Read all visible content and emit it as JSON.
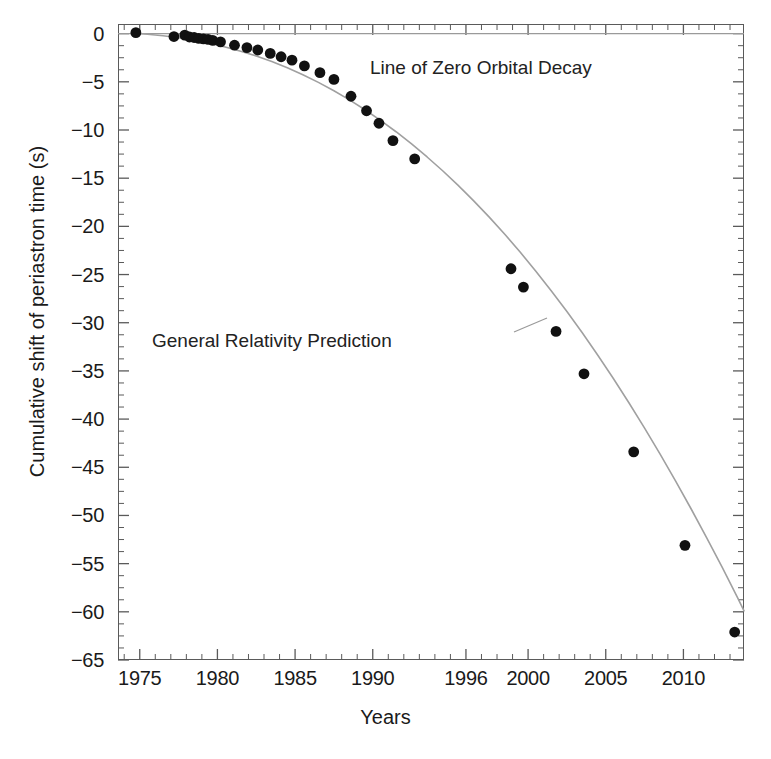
{
  "chart_data": {
    "type": "scatter",
    "title": "",
    "xlabel": "Years",
    "ylabel": "Cumulative shift of periastron time (s)",
    "xlim": [
      1973.6,
      2013.9
    ],
    "ylim": [
      -65,
      1.0
    ],
    "grid": false,
    "legend": "none",
    "xticks": [
      1975,
      1980,
      1985,
      1990,
      1996,
      2000,
      2005,
      2010
    ],
    "xtick_labels": [
      "1975",
      "1980",
      "1985",
      "1990",
      "1996",
      "2000",
      "2005",
      "2010"
    ],
    "yticks": [
      0,
      -5,
      -10,
      -15,
      -20,
      -25,
      -30,
      -35,
      -40,
      -45,
      -50,
      -55,
      -60,
      -65
    ],
    "ytick_labels": [
      "0",
      "−5",
      "−10",
      "−15",
      "−20",
      "−25",
      "−30",
      "−35",
      "−40",
      "−45",
      "−50",
      "−55",
      "−60",
      "−65"
    ],
    "x_minor_tick_step": 1,
    "y_minor_tick_step": 1.25,
    "annotations": [
      {
        "id": "zero-decay",
        "text": "Line of Zero Orbital Decay",
        "x": 1990.0,
        "y": -1.6
      },
      {
        "id": "gr-prediction",
        "text": "General Relativity Prediction",
        "x": 1979.0,
        "y": -29.6
      }
    ],
    "reference_lines": [
      {
        "id": "zero-line",
        "orientation": "horizontal",
        "y": 0,
        "color": "#9a9a9a",
        "label": "Line of Zero Orbital Decay"
      }
    ],
    "series": [
      {
        "name": "General Relativity Prediction",
        "type": "line",
        "color": "#a0a0a0",
        "points": [
          [
            1974.6,
            0.05
          ],
          [
            1975.5,
            -0.07
          ],
          [
            1976.5,
            -0.22
          ],
          [
            1977.5,
            -0.42
          ],
          [
            1978.5,
            -0.68
          ],
          [
            1979.5,
            -1.0
          ],
          [
            1980.5,
            -1.38
          ],
          [
            1981.5,
            -1.82
          ],
          [
            1982.5,
            -2.32
          ],
          [
            1983.5,
            -2.9
          ],
          [
            1984.5,
            -3.55
          ],
          [
            1985.5,
            -4.27
          ],
          [
            1986.5,
            -5.06
          ],
          [
            1987.5,
            -5.93
          ],
          [
            1988.5,
            -6.88
          ],
          [
            1989.5,
            -7.9
          ],
          [
            1990.5,
            -9.0
          ],
          [
            1991.5,
            -10.18
          ],
          [
            1992.5,
            -11.45
          ],
          [
            1993.5,
            -12.8
          ],
          [
            1994.5,
            -14.23
          ],
          [
            1995.5,
            -15.75
          ],
          [
            1996.5,
            -17.35
          ],
          [
            1997.5,
            -19.04
          ],
          [
            1998.5,
            -20.82
          ],
          [
            1999.5,
            -22.69
          ],
          [
            2000.5,
            -24.65
          ],
          [
            2001.5,
            -26.7
          ],
          [
            2002.5,
            -28.84
          ],
          [
            2003.5,
            -31.07
          ],
          [
            2004.5,
            -33.4
          ],
          [
            2005.5,
            -35.82
          ],
          [
            2006.5,
            -38.33
          ],
          [
            2007.5,
            -40.94
          ],
          [
            2008.5,
            -43.64
          ],
          [
            2009.5,
            -46.44
          ],
          [
            2010.5,
            -49.33
          ],
          [
            2011.5,
            -52.32
          ],
          [
            2012.5,
            -55.4
          ],
          [
            2013.5,
            -58.58
          ],
          [
            2013.9,
            -59.9
          ]
        ]
      },
      {
        "name": "Measured cumulative periastron shift",
        "type": "scatter",
        "color": "#111111",
        "marker": "filled-circle",
        "points": [
          [
            1974.75,
            0.1
          ],
          [
            1977.2,
            -0.3
          ],
          [
            1977.9,
            -0.15
          ],
          [
            1978.2,
            -0.35
          ],
          [
            1978.5,
            -0.4
          ],
          [
            1978.8,
            -0.5
          ],
          [
            1979.1,
            -0.55
          ],
          [
            1979.4,
            -0.6
          ],
          [
            1979.7,
            -0.7
          ],
          [
            1980.2,
            -0.85
          ],
          [
            1981.1,
            -1.2
          ],
          [
            1981.9,
            -1.45
          ],
          [
            1982.6,
            -1.7
          ],
          [
            1983.4,
            -2.05
          ],
          [
            1984.1,
            -2.4
          ],
          [
            1984.8,
            -2.75
          ],
          [
            1985.6,
            -3.35
          ],
          [
            1986.6,
            -4.05
          ],
          [
            1987.5,
            -4.75
          ],
          [
            1988.6,
            -6.5
          ],
          [
            1989.6,
            -8.0
          ],
          [
            1990.4,
            -9.3
          ],
          [
            1991.3,
            -11.1
          ],
          [
            1992.7,
            -13.0
          ],
          [
            1998.9,
            -24.4
          ],
          [
            1999.7,
            -26.3
          ],
          [
            2001.8,
            -30.9
          ],
          [
            2003.6,
            -35.3
          ],
          [
            2006.8,
            -43.4
          ],
          [
            2010.1,
            -53.1
          ],
          [
            2013.3,
            -62.1
          ]
        ]
      }
    ]
  },
  "figure": {
    "background": "#ffffff",
    "frame_color": "#5a5a5a",
    "marker_color": "#111111",
    "curve_color": "#a0a0a0",
    "zero_line_color": "#9a9a9a"
  }
}
